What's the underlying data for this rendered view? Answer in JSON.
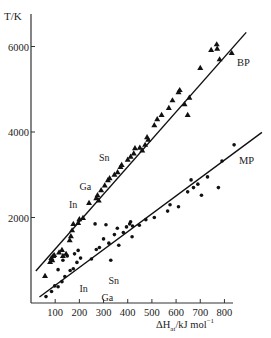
{
  "chart_data": {
    "type": "scatter",
    "title": "",
    "xlabel": "ΔH°at/kJ mol⁻¹",
    "xlabel_main": "ΔH",
    "xlabel_sup": "o",
    "xlabel_sub": "at",
    "xlabel_rest": "/kJ  mol",
    "xlabel_exp": "−1",
    "ylabel": "T/K",
    "xlim": [
      0,
      860
    ],
    "ylim": [
      0,
      6600
    ],
    "x_ticks": [
      100,
      200,
      300,
      400,
      500,
      600,
      700,
      800
    ],
    "x_tick_labels": [
      "100",
      "200",
      "300",
      "400",
      "500",
      "600",
      "700",
      "800"
    ],
    "y_ticks": [
      2000,
      4000,
      6000
    ],
    "y_tick_labels": [
      "2000",
      "4000",
      "6000"
    ],
    "grid": false,
    "legend": "none",
    "series": [
      {
        "name": "BP",
        "marker": "triangle",
        "label": "BP",
        "fit_line": {
          "x": [
            20,
            890
          ],
          "y": [
            750,
            6330
          ]
        },
        "points": [
          [
            58,
            630
          ],
          [
            79,
            960
          ],
          [
            84,
            1050
          ],
          [
            88,
            1000
          ],
          [
            92,
            1100
          ],
          [
            96,
            1120
          ],
          [
            116,
            1180
          ],
          [
            128,
            1240
          ],
          [
            132,
            1100
          ],
          [
            145,
            1150
          ],
          [
            160,
            1470
          ],
          [
            165,
            1560
          ],
          [
            170,
            1700
          ],
          [
            175,
            1850
          ],
          [
            195,
            1870
          ],
          [
            200,
            1960
          ],
          [
            215,
            1990
          ],
          [
            240,
            2340
          ],
          [
            270,
            2450
          ],
          [
            275,
            2520
          ],
          [
            280,
            2400
          ],
          [
            290,
            2640
          ],
          [
            305,
            2750
          ],
          [
            318,
            2870
          ],
          [
            325,
            2920
          ],
          [
            345,
            3000
          ],
          [
            358,
            3060
          ],
          [
            370,
            3180
          ],
          [
            375,
            3230
          ],
          [
            400,
            3350
          ],
          [
            412,
            3420
          ],
          [
            425,
            3500
          ],
          [
            430,
            3620
          ],
          [
            450,
            3630
          ],
          [
            460,
            3570
          ],
          [
            472,
            3700
          ],
          [
            485,
            3820
          ],
          [
            480,
            3880
          ],
          [
            510,
            4160
          ],
          [
            522,
            4300
          ],
          [
            540,
            4400
          ],
          [
            570,
            4560
          ],
          [
            585,
            4740
          ],
          [
            610,
            4930
          ],
          [
            615,
            4980
          ],
          [
            635,
            4650
          ],
          [
            655,
            4800
          ],
          [
            648,
            4400
          ],
          [
            700,
            5500
          ],
          [
            745,
            5920
          ],
          [
            770,
            5950
          ],
          [
            768,
            6050
          ],
          [
            780,
            5700
          ],
          [
            830,
            5850
          ]
        ]
      },
      {
        "name": "MP",
        "marker": "dot",
        "label": "MP",
        "fit_line": {
          "x": [
            35,
            955
          ],
          "y": [
            140,
            3990
          ]
        },
        "points": [
          [
            62,
            150
          ],
          [
            85,
            270
          ],
          [
            98,
            400
          ],
          [
            112,
            380
          ],
          [
            128,
            500
          ],
          [
            140,
            620
          ],
          [
            112,
            780
          ],
          [
            132,
            1000
          ],
          [
            150,
            1100
          ],
          [
            162,
            760
          ],
          [
            175,
            800
          ],
          [
            190,
            950
          ],
          [
            180,
            1150
          ],
          [
            195,
            1230
          ],
          [
            205,
            1050
          ],
          [
            250,
            1030
          ],
          [
            270,
            1250
          ],
          [
            283,
            1300
          ],
          [
            300,
            1500
          ],
          [
            322,
            1400
          ],
          [
            345,
            1600
          ],
          [
            357,
            1750
          ],
          [
            363,
            1350
          ],
          [
            382,
            1650
          ],
          [
            395,
            1780
          ],
          [
            408,
            1850
          ],
          [
            412,
            1900
          ],
          [
            420,
            1800
          ],
          [
            418,
            1550
          ],
          [
            448,
            1820
          ],
          [
            475,
            1950
          ],
          [
            510,
            2000
          ],
          [
            565,
            2150
          ],
          [
            575,
            2300
          ],
          [
            610,
            2250
          ],
          [
            648,
            2600
          ],
          [
            662,
            2880
          ],
          [
            672,
            2700
          ],
          [
            690,
            2780
          ],
          [
            705,
            2520
          ],
          [
            730,
            2950
          ],
          [
            775,
            2700
          ],
          [
            790,
            3320
          ],
          [
            840,
            3700
          ],
          [
            330,
            1000
          ],
          [
            265,
            1850
          ],
          [
            310,
            1830
          ]
        ]
      }
    ],
    "annotations": [
      {
        "text": "Sn",
        "series": "BP",
        "x": 360,
        "y": 3230
      },
      {
        "text": "Ga",
        "series": "BP",
        "x": 275,
        "y": 2520
      },
      {
        "text": "In",
        "series": "BP",
        "x": 215,
        "y": 2300
      },
      {
        "text": "Sn",
        "series": "MP",
        "x": 300,
        "y": 500
      },
      {
        "text": "In",
        "series": "MP",
        "x": 250,
        "y": 340
      },
      {
        "text": "Ga",
        "series": "MP",
        "x": 275,
        "y": 190
      }
    ]
  }
}
